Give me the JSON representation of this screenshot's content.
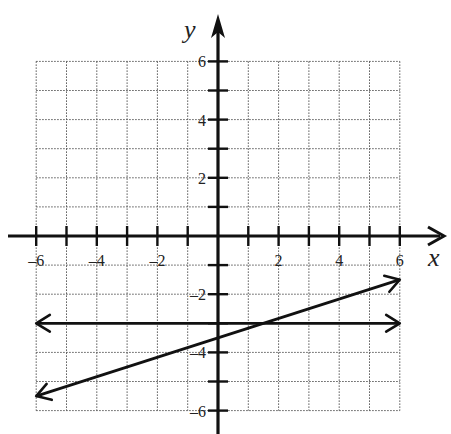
{
  "chart_data": {
    "type": "line",
    "title": "",
    "xlabel": "x",
    "ylabel": "y",
    "xlim": [
      -6,
      6
    ],
    "ylim": [
      -6,
      6
    ],
    "grid": true,
    "grid_style": "dotted",
    "x_ticks": [
      -6,
      -5,
      -4,
      -3,
      -2,
      -1,
      1,
      2,
      3,
      4,
      5,
      6
    ],
    "y_ticks": [
      -6,
      -5,
      -4,
      -3,
      -2,
      -1,
      1,
      2,
      3,
      4,
      5,
      6
    ],
    "x_tick_labels": [
      "-6",
      "-4",
      "-2",
      "2",
      "4",
      "6"
    ],
    "y_tick_labels": [
      "6",
      "4",
      "2",
      "-2",
      "-4",
      "-6"
    ],
    "series": [
      {
        "name": "horizontal line",
        "equation": "y = -3",
        "x": [
          -6,
          6
        ],
        "y": [
          -3,
          -3
        ],
        "arrows": "both"
      },
      {
        "name": "slanted line",
        "equation": "y = (1/3)x - 3.5",
        "x": [
          -6,
          6
        ],
        "y": [
          -5.5,
          -1.5
        ],
        "arrows": "both"
      }
    ],
    "legend": null
  },
  "axes": {
    "x_label": "x",
    "y_label": "y",
    "x_labels": [
      {
        "value": -6,
        "text": "-6"
      },
      {
        "value": -4,
        "text": "-4"
      },
      {
        "value": -2,
        "text": "-2"
      },
      {
        "value": 2,
        "text": "2"
      },
      {
        "value": 4,
        "text": "4"
      },
      {
        "value": 6,
        "text": "6"
      }
    ],
    "y_labels": [
      {
        "value": 6,
        "text": "6"
      },
      {
        "value": 4,
        "text": "4"
      },
      {
        "value": 2,
        "text": "2"
      },
      {
        "value": -2,
        "text": "-2"
      },
      {
        "value": -4,
        "text": "-4"
      },
      {
        "value": -6,
        "text": "-6"
      }
    ]
  },
  "colors": {
    "ink": "#111111",
    "grid": "#555555",
    "background": "#ffffff"
  }
}
